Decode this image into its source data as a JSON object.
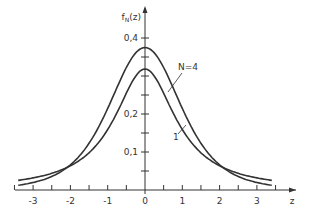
{
  "chart_data": {
    "type": "line",
    "title": "",
    "xlabel": "z",
    "ylabel": "f_N(z)",
    "xlim": [
      -3.4,
      3.4
    ],
    "ylim": [
      0,
      0.42
    ],
    "x_ticks": [
      -3,
      -2,
      -1,
      0,
      1,
      2,
      3
    ],
    "x_tick_labels": [
      "-3",
      "-2",
      "-1",
      "0",
      "1",
      "2",
      "3"
    ],
    "y_ticks": [
      0.1,
      0.2,
      0.4
    ],
    "y_tick_labels": [
      "0,1",
      "0,2",
      "0,4"
    ],
    "grid": false,
    "annotations": [
      {
        "text": "N=4",
        "points_to": "N=4 curve",
        "at": [
          1.05,
          0.335
        ]
      },
      {
        "text": "1",
        "points_to": "N=1 curve",
        "at": [
          0.95,
          0.16
        ]
      }
    ],
    "x": [
      -3.4,
      -3.0,
      -2.6,
      -2.2,
      -2.0,
      -1.8,
      -1.6,
      -1.4,
      -1.2,
      -1.0,
      -0.8,
      -0.6,
      -0.4,
      -0.2,
      0.0,
      0.2,
      0.4,
      0.6,
      0.8,
      1.0,
      1.2,
      1.4,
      1.6,
      1.8,
      2.0,
      2.2,
      2.6,
      3.0,
      3.4
    ],
    "series": [
      {
        "name": "N=1",
        "values": [
          0.0253,
          0.0318,
          0.041,
          0.0547,
          0.0637,
          0.0748,
          0.0879,
          0.1072,
          0.1306,
          0.1592,
          0.1941,
          0.2341,
          0.2745,
          0.3061,
          0.3183,
          0.3061,
          0.2745,
          0.2341,
          0.1941,
          0.1592,
          0.1306,
          0.1072,
          0.0879,
          0.0748,
          0.0637,
          0.0547,
          0.041,
          0.0318,
          0.0253
        ]
      },
      {
        "name": "N=4",
        "values": [
          0.0154,
          0.0197,
          0.0331,
          0.052,
          0.0663,
          0.0831,
          0.1028,
          0.1248,
          0.1486,
          0.172,
          0.201,
          0.2583,
          0.3011,
          0.3572,
          0.375,
          0.3572,
          0.3011,
          0.2583,
          0.201,
          0.172,
          0.1486,
          0.1248,
          0.1028,
          0.0831,
          0.0663,
          0.052,
          0.0331,
          0.0197,
          0.0154
        ]
      }
    ]
  }
}
